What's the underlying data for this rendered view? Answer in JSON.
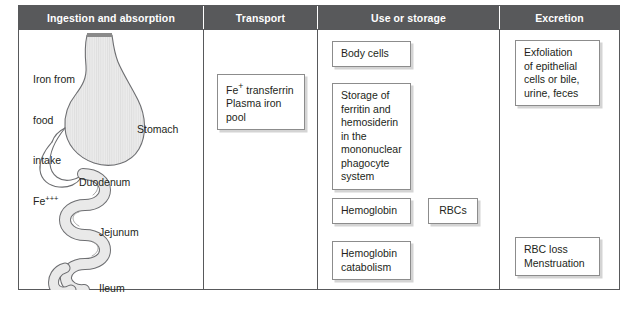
{
  "figure": {
    "headers": [
      {
        "label": "Ingestion and absorption"
      },
      {
        "label": "Transport"
      },
      {
        "label": "Use or storage"
      },
      {
        "label": "Excretion"
      }
    ],
    "header_background": "#58595b",
    "header_text_color": "#ffffff",
    "border_color": "#58595b",
    "box_border_color": "#8c8c8c",
    "box_shadow_color": "#d4d4d4",
    "organ_fill_color": "#e8e8e8",
    "organ_outline_color": "#6d6e71"
  },
  "ingestion": {
    "intake_label": {
      "line1": "Iron from",
      "line2": "food",
      "line3": "intake",
      "element": "Fe",
      "charge": "+++"
    },
    "organ_labels": [
      {
        "name": "stomach-label",
        "text": "Stomach"
      },
      {
        "name": "duodenum-label",
        "text": "Duodenum"
      },
      {
        "name": "jejunum-label",
        "text": "Jejunum"
      },
      {
        "name": "ileum-label",
        "text": "Ileum"
      }
    ]
  },
  "transport": {
    "box": {
      "line1_element": "Fe",
      "line1_charge": "+",
      "line1_rest": " transferrin",
      "line2": "Plasma iron pool"
    }
  },
  "use_or_storage": {
    "body_cells": "Body cells",
    "storage": {
      "line1": "Storage of",
      "line2": "ferritin and",
      "line3": "hemosiderin",
      "line4": "in the",
      "line5": "mononuclear",
      "line6": "phagocyte",
      "line7": "system"
    },
    "hemoglobin": "Hemoglobin",
    "rbcs": "RBCs",
    "catabolism": {
      "line1": "Hemoglobin",
      "line2": "catabolism"
    }
  },
  "excretion": {
    "exfoliation": {
      "line1": "Exfoliation",
      "line2": "of epithelial",
      "line3": "cells or bile,",
      "line4": "urine, feces"
    },
    "rbc_loss": {
      "line1": "RBC loss",
      "line2": "Menstruation"
    }
  }
}
